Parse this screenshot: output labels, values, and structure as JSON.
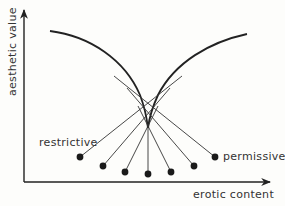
{
  "diagram": {
    "y_axis_label": "aesthetic value",
    "x_axis_label": "erotic content",
    "left_label": "restrictive",
    "right_label": "permissive",
    "colors": {
      "ink": "#222222",
      "background": "#fdfdfb",
      "text": "#333333"
    },
    "curve": {
      "description": "inverted V-shaped envelope curve (two arcs meeting at a cusp)",
      "left_start": [
        50,
        31
      ],
      "cusp": [
        148,
        128
      ],
      "right_end": [
        247,
        34
      ]
    },
    "points": [
      {
        "x": 80,
        "y": 157
      },
      {
        "x": 103,
        "y": 166
      },
      {
        "x": 125,
        "y": 172
      },
      {
        "x": 148,
        "y": 174
      },
      {
        "x": 171,
        "y": 172
      },
      {
        "x": 194,
        "y": 166
      },
      {
        "x": 215,
        "y": 157
      }
    ]
  }
}
